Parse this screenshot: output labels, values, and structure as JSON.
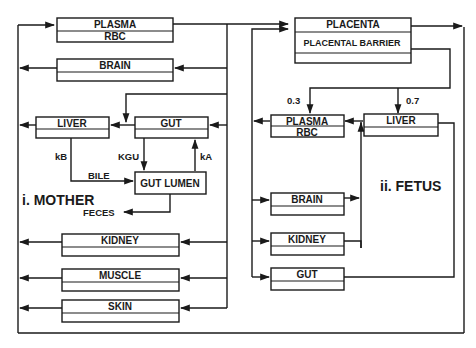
{
  "mother": {
    "title": "i. MOTHER",
    "plasma": {
      "top": "PLASMA",
      "bottom": "RBC"
    },
    "brain": "BRAIN",
    "liver": "LIVER",
    "gut": "GUT",
    "gut_lumen": "GUT LUMEN",
    "kidney": "KIDNEY",
    "muscle": "MUSCLE",
    "skin": "SKIN",
    "edges": {
      "kB": "kB",
      "KGU": "KGU",
      "kA": "kA",
      "bile": "BILE",
      "feces": "FECES"
    }
  },
  "placenta": {
    "top": "PLACENTA",
    "barrier": "PLACENTAL BARRIER",
    "split_plasma": "0.3",
    "split_liver": "0.7"
  },
  "fetus": {
    "title": "ii. FETUS",
    "plasma": {
      "top": "PLASMA",
      "bottom": "RBC"
    },
    "liver": "LIVER",
    "brain": "BRAIN",
    "kidney": "KIDNEY",
    "gut": "GUT"
  }
}
